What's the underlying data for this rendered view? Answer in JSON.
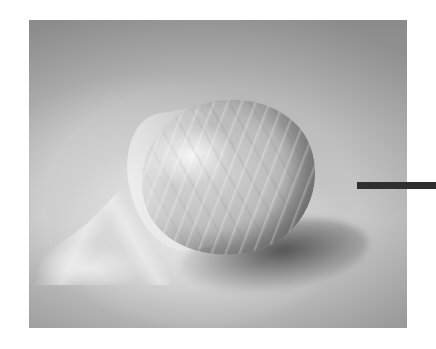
{
  "image": {
    "subject": "dough ball wrapped in plastic wrap on a countertop",
    "style": "grayscale photograph",
    "photo_box": {
      "x": 29,
      "y": 20,
      "width": 378,
      "height": 308
    }
  },
  "annotation": {
    "type": "pointer-bar",
    "color": "#2f2f2f",
    "x": 357,
    "y": 182,
    "width": 79,
    "height": 7
  },
  "colors": {
    "background": "#ffffff",
    "surface": "#bdbdbd",
    "dough": "#c4c4c4",
    "shadow": "#3c3c3c"
  }
}
